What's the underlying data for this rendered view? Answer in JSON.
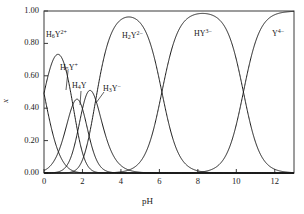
{
  "chart_data": {
    "type": "line",
    "title": "",
    "xlabel": "pH",
    "ylabel": "x",
    "xlim": [
      0,
      13
    ],
    "ylim": [
      0,
      1.0
    ],
    "grid": false,
    "legend_position": "inline-annotations",
    "xticks": [
      "0",
      "2",
      "4",
      "6",
      "8",
      "10",
      "12"
    ],
    "xtick_values": [
      0,
      2,
      4,
      6,
      8,
      10,
      12
    ],
    "yticks": [
      "0.00",
      "0.20",
      "0.40",
      "0.60",
      "0.80",
      "1.00"
    ],
    "ytick_values": [
      0.0,
      0.2,
      0.4,
      0.6,
      0.8,
      1.0
    ],
    "pka_values": [
      0.0,
      1.5,
      2.0,
      2.69,
      6.13,
      10.37
    ],
    "line_color": "#1a1a1a",
    "series": [
      {
        "name": "H6Y2+",
        "label_html": "H<sub>6</sub>Y<sup>2+</sup>",
        "label_x_px": 46,
        "label_y_px": 29,
        "peak_ph": 0.0,
        "peak_value": 1.0,
        "values": [
          0.86,
          0.53,
          0.24,
          0.08,
          0.03,
          0.007,
          0.002,
          0.0005,
          0.0001,
          0.0,
          0.0,
          0.0,
          0.0,
          0.0
        ]
      },
      {
        "name": "H5Y+",
        "label_html": "H<sub>5</sub>Y<sup>+</sup>",
        "label_x_px": 60,
        "label_y_px": 62,
        "peak_ph": 0.75,
        "peak_value": 0.45,
        "values": [
          0.027,
          0.42,
          0.43,
          0.26,
          0.12,
          0.04,
          0.012,
          0.003,
          0.001,
          0.0,
          0.0,
          0.0,
          0.0,
          0.0
        ]
      },
      {
        "name": "H4Y",
        "label_html": "H<sub>4</sub>Y",
        "label_x_px": 72,
        "label_y_px": 82,
        "peak_ph": 1.75,
        "peak_value": 0.42,
        "values": [
          0.0,
          0.04,
          0.42,
          0.41,
          0.24,
          0.09,
          0.028,
          0.008,
          0.002,
          0.0,
          0.0,
          0.0,
          0.0,
          0.0
        ]
      },
      {
        "name": "H3Y-",
        "label_html": "H<sub>3</sub>Y<sup>−</sup>",
        "label_x_px": 103,
        "label_y_px": 83,
        "peak_ph": 2.35,
        "peak_value": 0.46,
        "values": [
          0.0,
          0.004,
          0.16,
          0.45,
          0.4,
          0.16,
          0.05,
          0.015,
          0.004,
          0.001,
          0.0,
          0.0,
          0.0,
          0.0
        ]
      },
      {
        "name": "H2Y2-",
        "label_html": "H<sub>2</sub>Y<sup>2−</sup>",
        "label_x_px": 122,
        "label_y_px": 30,
        "peak_ph": 4.4,
        "peak_value": 0.97,
        "values": [
          0.0,
          0.0,
          0.01,
          0.32,
          0.88,
          0.96,
          0.86,
          0.43,
          0.07,
          0.008,
          0.001,
          0.0,
          0.0,
          0.0
        ]
      },
      {
        "name": "HY3-",
        "label_html": "HY<sup>3−</sup>",
        "label_x_px": 194,
        "label_y_px": 28,
        "peak_ph": 8.25,
        "peak_value": 1.0,
        "values": [
          0.0,
          0.0,
          0.0,
          0.0,
          0.0,
          0.009,
          0.13,
          0.56,
          0.93,
          0.98,
          0.81,
          0.32,
          0.05,
          0.005
        ]
      },
      {
        "name": "Y4-",
        "label_html": "Y<sup>4−</sup>",
        "label_x_px": 272,
        "label_y_px": 28,
        "peak_ph": 13.0,
        "peak_value": 1.0,
        "values": [
          0.0,
          0.0,
          0.0,
          0.0,
          0.0,
          0.0,
          0.0,
          0.0,
          0.002,
          0.02,
          0.19,
          0.68,
          0.95,
          0.995
        ]
      }
    ]
  },
  "axes": {
    "xlabel": "pH",
    "ylabel": "x"
  }
}
